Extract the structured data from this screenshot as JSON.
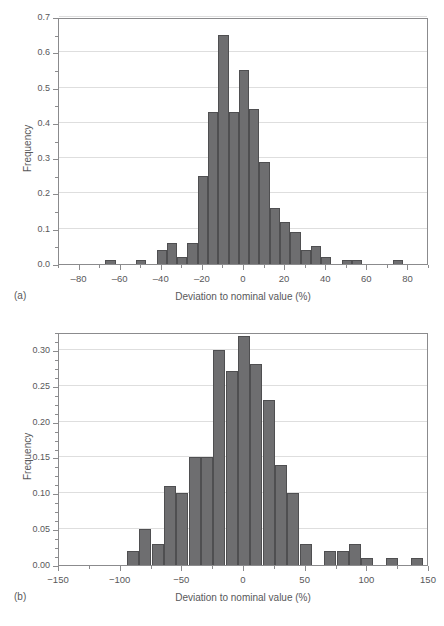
{
  "figure": {
    "background": "#ffffff",
    "bar_fill": "#6e6e70",
    "bar_edge": "#4f4f51",
    "axis_color": "#8b8b8d",
    "grid_color": "#dedede",
    "text_color": "#58585a"
  },
  "panels": [
    {
      "tag": "(a)"
    },
    {
      "tag": "(b)"
    }
  ],
  "chart_data": [
    {
      "type": "bar",
      "panel": "(a)",
      "title": "",
      "xlabel": "Deviation to nominal value (%)",
      "ylabel": "Frequency",
      "xlim": [
        -90,
        90
      ],
      "ylim": [
        0.0,
        0.7
      ],
      "grid": true,
      "legend": "none",
      "bin_width": 5,
      "xticks": [
        -80,
        -60,
        -40,
        -20,
        0,
        20,
        40,
        60,
        80
      ],
      "xtick_labels": [
        "‒80",
        "‒60",
        "‒40",
        "‒20",
        "0",
        "20",
        "40",
        "60",
        "80"
      ],
      "xtick_minor_step": 10,
      "yticks": [
        0.0,
        0.1,
        0.2,
        0.3,
        0.4,
        0.5,
        0.6,
        0.7
      ],
      "ytick_labels": [
        "0.0",
        "0.1",
        "0.2",
        "0.3",
        "0.4",
        "0.5",
        "0.6",
        "0.7"
      ],
      "ytick_minor_step": 0.05,
      "bin_left_edges": [
        -67.5,
        -52.5,
        -42.5,
        -37.5,
        -32.5,
        -27.5,
        -22.5,
        -17.5,
        -12.5,
        -7.5,
        -2.5,
        2.5,
        7.5,
        12.5,
        17.5,
        22.5,
        27.5,
        32.5,
        37.5,
        47.5,
        52.5,
        72.5
      ],
      "categories": [
        "-65",
        "-50",
        "-40",
        "-35",
        "-30",
        "-25",
        "-20",
        "-15",
        "-10",
        "-5",
        "0",
        "5",
        "10",
        "15",
        "20",
        "25",
        "30",
        "35",
        "40",
        "50",
        "55",
        "75"
      ],
      "values": [
        0.01,
        0.01,
        0.04,
        0.06,
        0.02,
        0.06,
        0.25,
        0.43,
        0.65,
        0.43,
        0.55,
        0.44,
        0.29,
        0.16,
        0.12,
        0.09,
        0.04,
        0.05,
        0.02,
        0.01,
        0.01,
        0.01
      ]
    },
    {
      "type": "bar",
      "panel": "(b)",
      "title": "",
      "xlabel": "Deviation to nominal value (%)",
      "ylabel": "Frequency",
      "xlim": [
        -150,
        150
      ],
      "ylim": [
        0.0,
        0.325
      ],
      "grid": true,
      "legend": "none",
      "bin_width": 10,
      "xticks": [
        -150,
        -100,
        -50,
        0,
        50,
        100,
        150
      ],
      "xtick_labels": [
        "−150",
        "−100",
        "−50",
        "0",
        "50",
        "100",
        "150"
      ],
      "xtick_minor_step": 25,
      "yticks": [
        0.0,
        0.05,
        0.1,
        0.15,
        0.2,
        0.25,
        0.3
      ],
      "ytick_labels": [
        "0.00",
        "0.05",
        "0.10",
        "0.15",
        "0.20",
        "0.25",
        "0.30"
      ],
      "ytick_minor_step": 0.0125,
      "bin_left_edges": [
        -95,
        -85,
        -75,
        -65,
        -55,
        -45,
        -35,
        -25,
        -15,
        -5,
        5,
        15,
        25,
        35,
        45,
        65,
        75,
        85,
        95,
        115,
        135
      ],
      "categories": [
        "-90",
        "-80",
        "-70",
        "-60",
        "-50",
        "-40",
        "-30",
        "-20",
        "-10",
        "0",
        "10",
        "20",
        "30",
        "40",
        "50",
        "70",
        "80",
        "90",
        "100",
        "120",
        "140"
      ],
      "values": [
        0.02,
        0.05,
        0.03,
        0.11,
        0.1,
        0.15,
        0.15,
        0.3,
        0.27,
        0.32,
        0.28,
        0.23,
        0.14,
        0.1,
        0.03,
        0.02,
        0.02,
        0.03,
        0.01,
        0.01,
        0.01
      ]
    }
  ]
}
